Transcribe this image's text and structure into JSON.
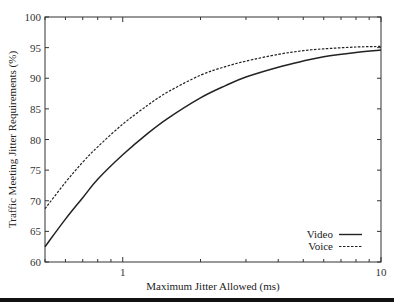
{
  "chart_data": {
    "type": "line",
    "title": "",
    "xlabel": "Maximum Jitter Allowed (ms)",
    "ylabel": "Traffic Meeting Jitter Requirements (%)",
    "xscale": "log",
    "xlim": [
      0.5,
      10
    ],
    "ylim": [
      60,
      100
    ],
    "xticks": [
      1,
      10
    ],
    "xtick_labels": [
      "1",
      "10"
    ],
    "yticks": [
      60,
      65,
      70,
      75,
      80,
      85,
      90,
      95,
      100
    ],
    "ytick_labels": [
      "60",
      "65",
      "70",
      "75",
      "80",
      "85",
      "90",
      "95",
      "100"
    ],
    "grid": false,
    "legend_position": "lower right",
    "series": [
      {
        "name": "Video",
        "style": "solid",
        "x": [
          0.5,
          0.6,
          0.7,
          0.8,
          1.0,
          1.25,
          1.5,
          2.0,
          2.5,
          3.0,
          4.0,
          5.0,
          6.0,
          8.0,
          10.0
        ],
        "values": [
          62.5,
          67.0,
          70.5,
          73.5,
          77.5,
          81.0,
          83.5,
          86.8,
          88.8,
          90.2,
          91.8,
          92.8,
          93.5,
          94.2,
          94.6
        ]
      },
      {
        "name": "Voice",
        "style": "dashed",
        "x": [
          0.5,
          0.6,
          0.7,
          0.8,
          1.0,
          1.25,
          1.5,
          2.0,
          2.5,
          3.0,
          4.0,
          5.0,
          6.0,
          8.0,
          10.0
        ],
        "values": [
          68.7,
          73.0,
          76.3,
          78.8,
          82.5,
          85.6,
          87.8,
          90.5,
          91.9,
          92.8,
          93.9,
          94.5,
          94.8,
          95.1,
          95.2
        ]
      }
    ]
  },
  "legend": {
    "items": [
      {
        "label": "Video",
        "style": "solid"
      },
      {
        "label": "Voice",
        "style": "dashed"
      }
    ]
  },
  "colors": {
    "line": "#222222",
    "axis": "#333333",
    "rule": "#111111"
  }
}
